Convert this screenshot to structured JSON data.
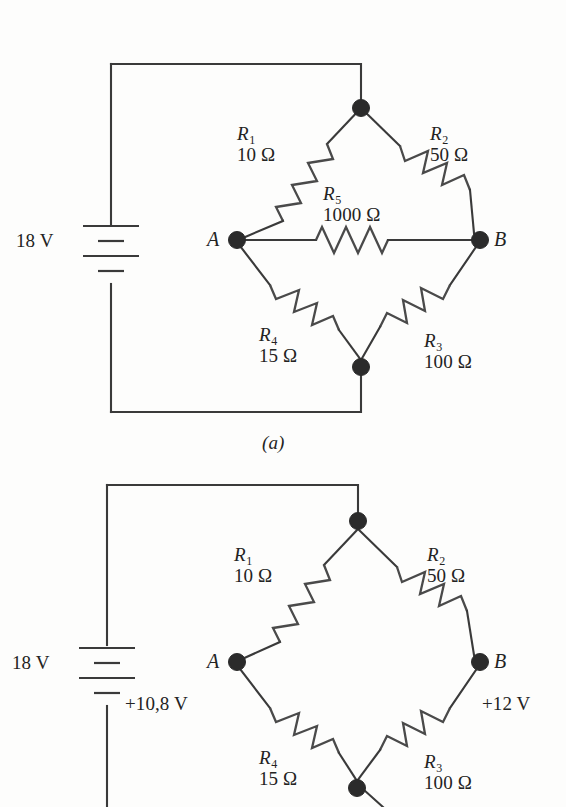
{
  "figure": {
    "type": "circuit-diagram",
    "panels": [
      {
        "id": "a",
        "caption": "(a)",
        "source": {
          "label": "18 V",
          "type": "battery"
        },
        "nodes": [
          {
            "name": "A",
            "label": "A"
          },
          {
            "name": "B",
            "label": "B"
          },
          {
            "name": "top",
            "label": ""
          },
          {
            "name": "bottom",
            "label": ""
          }
        ],
        "components": [
          {
            "name": "R1",
            "symbol": "R",
            "subscript": "1",
            "value": "10 Ω",
            "branch": "top-left"
          },
          {
            "name": "R2",
            "symbol": "R",
            "subscript": "2",
            "value": "50 Ω",
            "branch": "top-right"
          },
          {
            "name": "R3",
            "symbol": "R",
            "subscript": "3",
            "value": "100 Ω",
            "branch": "bottom-right"
          },
          {
            "name": "R4",
            "symbol": "R",
            "subscript": "4",
            "value": "15 Ω",
            "branch": "bottom-left"
          },
          {
            "name": "R5",
            "symbol": "R",
            "subscript": "5",
            "value": "1000 Ω",
            "branch": "bridge"
          }
        ]
      },
      {
        "id": "b",
        "caption": "",
        "source": {
          "label": "18 V",
          "type": "battery"
        },
        "nodes": [
          {
            "name": "A",
            "label": "A",
            "potential": "+10,8 V"
          },
          {
            "name": "B",
            "label": "B",
            "potential": "+12 V"
          },
          {
            "name": "top",
            "label": ""
          },
          {
            "name": "bottom",
            "label": ""
          }
        ],
        "components": [
          {
            "name": "R1",
            "symbol": "R",
            "subscript": "1",
            "value": "10 Ω",
            "branch": "top-left"
          },
          {
            "name": "R2",
            "symbol": "R",
            "subscript": "2",
            "value": "50 Ω",
            "branch": "top-right"
          },
          {
            "name": "R3",
            "symbol": "R",
            "subscript": "3",
            "value": "100 Ω",
            "branch": "bottom-right"
          },
          {
            "name": "R4",
            "symbol": "R",
            "subscript": "4",
            "value": "15 Ω",
            "branch": "bottom-left"
          }
        ]
      }
    ],
    "colors": {
      "background": "#fdfdfc",
      "wire": "#3a3a3a",
      "resistor": "#4a4a4a",
      "node": "#2b2b2b",
      "text": "#232323"
    }
  },
  "panel_a": {
    "source_label": "18 V",
    "r1_name": "R",
    "r1_sub": "1",
    "r1_value": "10 Ω",
    "r2_name": "R",
    "r2_sub": "2",
    "r2_value": "50 Ω",
    "r3_name": "R",
    "r3_sub": "3",
    "r3_value": "100 Ω",
    "r4_name": "R",
    "r4_sub": "4",
    "r4_value": "15 Ω",
    "r5_name": "R",
    "r5_sub": "5",
    "r5_value": "1000 Ω",
    "node_a": "A",
    "node_b": "B",
    "caption": "(a)"
  },
  "panel_b": {
    "source_label": "18 V",
    "r1_name": "R",
    "r1_sub": "1",
    "r1_value": "10 Ω",
    "r2_name": "R",
    "r2_sub": "2",
    "r2_value": "50 Ω",
    "r3_name": "R",
    "r3_sub": "3",
    "r3_value": "100 Ω",
    "r4_name": "R",
    "r4_sub": "4",
    "r4_value": "15 Ω",
    "node_a": "A",
    "node_b": "B",
    "node_a_potential": "+10,8 V",
    "node_b_potential": "+12 V"
  }
}
